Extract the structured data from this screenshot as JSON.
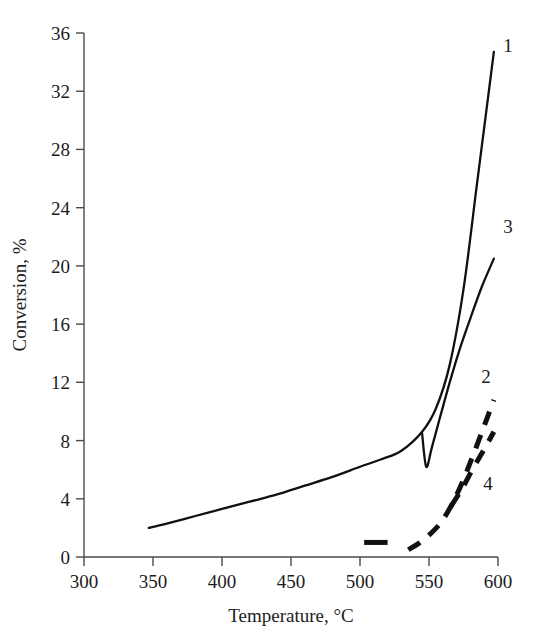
{
  "chart_data": {
    "type": "line",
    "title": "",
    "xlabel": "Temperature, °C",
    "ylabel": "Conversion, %",
    "xlim": [
      300,
      600
    ],
    "ylim": [
      0,
      36
    ],
    "xticks": [
      300,
      350,
      400,
      450,
      500,
      550,
      600
    ],
    "yticks": [
      0,
      4,
      8,
      12,
      16,
      20,
      24,
      28,
      32,
      36
    ],
    "xtick_labels": [
      "300",
      "350",
      "400",
      "450",
      "500",
      "550",
      "600"
    ],
    "ytick_labels": [
      "0",
      "4",
      "8",
      "12",
      "16",
      "20",
      "24",
      "28",
      "32",
      "36"
    ],
    "grid": false,
    "legend": "inline curve-end labels",
    "series": [
      {
        "name": "1",
        "label": "1",
        "style": "solid",
        "x": [
          347,
          360,
          380,
          400,
          420,
          440,
          460,
          480,
          500,
          515,
          530,
          545,
          555,
          565,
          575,
          585,
          597
        ],
        "y": [
          2.0,
          2.3,
          2.8,
          3.3,
          3.8,
          4.3,
          4.9,
          5.5,
          6.2,
          6.7,
          7.3,
          8.6,
          10.2,
          13.2,
          18.4,
          25.8,
          34.7
        ]
      },
      {
        "name": "3",
        "label": "3",
        "style": "solid",
        "x": [
          545,
          548,
          552,
          558,
          565,
          572,
          580,
          588,
          597
        ],
        "y": [
          8.5,
          6.2,
          7.5,
          9.6,
          12.0,
          14.2,
          16.4,
          18.5,
          20.5
        ]
      },
      {
        "name": "2",
        "label": "2",
        "style": "dashed",
        "x": [
          535,
          542,
          550,
          558,
          566,
          574,
          582,
          590,
          597
        ],
        "y": [
          0.5,
          0.9,
          1.5,
          2.3,
          3.5,
          5.1,
          7.0,
          9.0,
          10.8
        ]
      },
      {
        "name": "4",
        "label": "4",
        "style": "dashed",
        "x": [
          566,
          574,
          582,
          590,
          597
        ],
        "y": [
          3.5,
          4.7,
          6.1,
          7.4,
          8.6
        ]
      },
      {
        "name": "marker-segment",
        "label": "",
        "style": "dashed",
        "x": [
          503,
          520
        ],
        "y": [
          1.0,
          1.0
        ]
      }
    ],
    "curve_labels": [
      {
        "text": "1",
        "x": 600,
        "y": 34.9
      },
      {
        "text": "3",
        "x": 600,
        "y": 22.6
      },
      {
        "text": "2",
        "x": 598,
        "y": 11.9
      },
      {
        "text": "4",
        "x": 598,
        "y": 4.8
      }
    ]
  }
}
